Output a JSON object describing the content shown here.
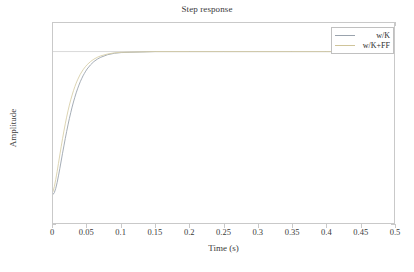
{
  "chart_data": {
    "type": "line",
    "title": "Step response",
    "xlabel": "Time (s)",
    "ylabel": "Amplitude",
    "xlim": [
      0,
      0.5
    ],
    "ylim": [
      -0.2,
      1.2
    ],
    "grid": false,
    "legend_position": "upper-right",
    "xticks": [
      "0",
      "0.05",
      "0.1",
      "0.15",
      "0.2",
      "0.25",
      "0.3",
      "0.35",
      "0.4",
      "0.45",
      "0.5"
    ],
    "xtick_values": [
      0,
      0.05,
      0.1,
      0.15,
      0.2,
      0.25,
      0.3,
      0.35,
      0.4,
      0.45,
      0.5
    ],
    "yticks": [
      "1.2",
      "1",
      "0.8",
      "0.6",
      "0.4",
      "0.2",
      "0",
      "-0.2"
    ],
    "ytick_values": [
      1.2,
      1,
      0.8,
      0.6,
      0.4,
      0.2,
      0,
      -0.2
    ],
    "reference_line": {
      "y": 1,
      "color": "#c8c8c8",
      "style": "solid"
    },
    "series": [
      {
        "name": "w/K",
        "color": "#9aa3ad",
        "x": [
          0,
          0.002,
          0.004,
          0.006,
          0.008,
          0.01,
          0.012,
          0.014,
          0.016,
          0.018,
          0.02,
          0.022,
          0.024,
          0.026,
          0.028,
          0.03,
          0.032,
          0.034,
          0.036,
          0.038,
          0.04,
          0.042,
          0.044,
          0.046,
          0.048,
          0.05,
          0.055,
          0.06,
          0.065,
          0.07,
          0.08,
          0.09,
          0.1,
          0.15,
          0.2,
          0.25,
          0.3,
          0.35,
          0.4,
          0.45,
          0.5
        ],
        "values": [
          0,
          0.013,
          0.042,
          0.082,
          0.13,
          0.181,
          0.234,
          0.288,
          0.34,
          0.391,
          0.44,
          0.487,
          0.531,
          0.572,
          0.611,
          0.647,
          0.68,
          0.711,
          0.739,
          0.765,
          0.789,
          0.81,
          0.83,
          0.847,
          0.863,
          0.878,
          0.907,
          0.93,
          0.947,
          0.96,
          0.978,
          0.988,
          0.993,
          1.0,
          1.0,
          1.0,
          1.0,
          1.0,
          1.0,
          1.0,
          1.0
        ]
      },
      {
        "name": "w/K+FF",
        "color": "#d8cfa8",
        "x": [
          0,
          0.002,
          0.004,
          0.006,
          0.008,
          0.01,
          0.012,
          0.014,
          0.016,
          0.018,
          0.02,
          0.022,
          0.024,
          0.026,
          0.028,
          0.03,
          0.032,
          0.034,
          0.036,
          0.038,
          0.04,
          0.042,
          0.044,
          0.046,
          0.048,
          0.05,
          0.055,
          0.06,
          0.065,
          0.07,
          0.08,
          0.09,
          0.1,
          0.15,
          0.2,
          0.25,
          0.3,
          0.35,
          0.4,
          0.45,
          0.5
        ],
        "values": [
          0.02,
          0.055,
          0.104,
          0.159,
          0.217,
          0.276,
          0.334,
          0.39,
          0.444,
          0.494,
          0.541,
          0.585,
          0.625,
          0.662,
          0.695,
          0.726,
          0.754,
          0.779,
          0.802,
          0.822,
          0.841,
          0.857,
          0.872,
          0.885,
          0.897,
          0.908,
          0.93,
          0.947,
          0.96,
          0.97,
          0.983,
          0.991,
          0.995,
          1.0,
          1.0,
          1.0,
          1.0,
          1.0,
          1.0,
          1.0,
          1.0
        ]
      }
    ]
  },
  "legend": {
    "items": [
      {
        "label": "w/K",
        "color": "#9aa3ad"
      },
      {
        "label": "w/K+FF",
        "color": "#cfc49a"
      }
    ]
  },
  "style": {
    "axis_color": "#c9c9c9",
    "text_color": "#2b2b2b",
    "background": "#ffffff"
  }
}
